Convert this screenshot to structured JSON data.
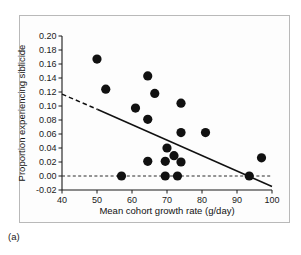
{
  "figure": {
    "caption_label": "(a)",
    "panel_background": "#fdfdfd",
    "border_color": "#b9b9b9"
  },
  "chart_data": {
    "type": "scatter",
    "title": "",
    "xlabel": "Mean cohort growth rate (g/day)",
    "ylabel": "Proportion experiencing siblicide",
    "xlim": [
      40,
      100
    ],
    "ylim": [
      -0.02,
      0.2
    ],
    "xticks": [
      40,
      50,
      60,
      70,
      80,
      90,
      100
    ],
    "xtick_labels": [
      "40",
      "50",
      "60",
      "70",
      "80",
      "90",
      "100"
    ],
    "yticks": [
      -0.02,
      0.0,
      0.02,
      0.04,
      0.06,
      0.08,
      0.1,
      0.12,
      0.14,
      0.16,
      0.18,
      0.2
    ],
    "ytick_labels": [
      "-0.02",
      "0.00",
      "0.02",
      "0.04",
      "0.06",
      "0.08",
      "0.10",
      "0.12",
      "0.14",
      "0.16",
      "0.18",
      "0.20"
    ],
    "grid": false,
    "legend": null,
    "marker": {
      "shape": "circle",
      "color": "#111111",
      "size": 4.6
    },
    "points": [
      {
        "x": 50.0,
        "y": 0.167
      },
      {
        "x": 52.5,
        "y": 0.124
      },
      {
        "x": 64.5,
        "y": 0.143
      },
      {
        "x": 66.5,
        "y": 0.118
      },
      {
        "x": 61.0,
        "y": 0.097
      },
      {
        "x": 74.0,
        "y": 0.104
      },
      {
        "x": 64.5,
        "y": 0.081
      },
      {
        "x": 74.0,
        "y": 0.062
      },
      {
        "x": 81.0,
        "y": 0.062
      },
      {
        "x": 70.0,
        "y": 0.04
      },
      {
        "x": 72.0,
        "y": 0.029
      },
      {
        "x": 64.5,
        "y": 0.021
      },
      {
        "x": 69.5,
        "y": 0.021
      },
      {
        "x": 74.0,
        "y": 0.02
      },
      {
        "x": 97.0,
        "y": 0.026
      },
      {
        "x": 57.0,
        "y": 0.0
      },
      {
        "x": 69.5,
        "y": 0.0
      },
      {
        "x": 73.0,
        "y": 0.0
      },
      {
        "x": 93.5,
        "y": 0.0
      }
    ],
    "regression_line": {
      "style": "dashed-then-solid",
      "color": "#111111",
      "x_start": 40,
      "y_start": 0.117,
      "x_dash_end": 50.2,
      "y_dash_end": 0.095,
      "x_end": 100,
      "y_end": -0.015
    },
    "reference_line": {
      "orientation": "horizontal",
      "y": 0.0,
      "style": "dashed",
      "color": "#2a2a2a"
    }
  }
}
